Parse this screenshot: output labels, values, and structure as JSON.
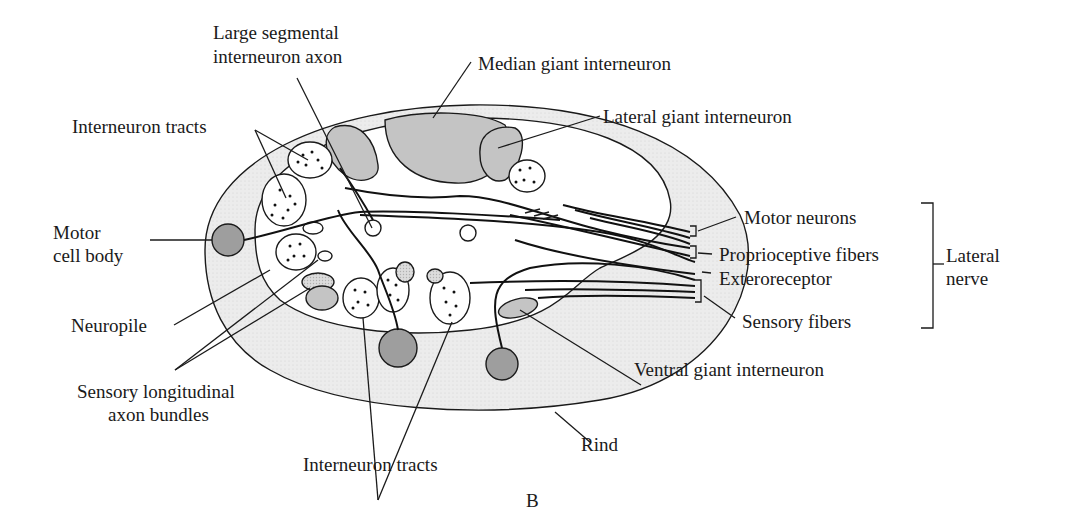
{
  "figure": {
    "panel_label": "B"
  },
  "labels": {
    "large_segmental": [
      "Large segmental",
      "interneuron axon"
    ],
    "median_giant": "Median giant interneuron",
    "lateral_giant": "Lateral giant interneuron",
    "interneuron_tracts_top": "Interneuron tracts",
    "motor_cell_body": [
      "Motor",
      "cell body"
    ],
    "neuropile": "Neuropile",
    "sensory_longitudinal": [
      "Sensory longitudinal",
      "axon bundles"
    ],
    "interneuron_tracts_bottom": "Interneuron tracts",
    "rind": "Rind",
    "ventral_giant": "Ventral giant interneuron",
    "motor_neurons": "Motor neurons",
    "proprioceptive": "Proprioceptive fibers",
    "exteroreceptor": "Exteroreceptor",
    "sensory_fibers": "Sensory fibers",
    "lateral_nerve": [
      "Lateral",
      "nerve"
    ]
  },
  "colors": {
    "rind_fill": "#ececec",
    "giant_fill": "#c4c4c4",
    "cell_body_fill": "#9e9e9e",
    "neuropile_fill": "#ffffff",
    "ink": "#1a1a1a"
  }
}
